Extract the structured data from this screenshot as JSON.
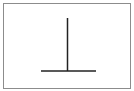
{
  "diagram": {
    "type": "inverted-t-shape",
    "frame": {
      "border_color": "#8c8c8c",
      "background": "#ffffff"
    },
    "stroke_color": "#222222",
    "vertical_line": {
      "x": 67.5,
      "y1": 18,
      "y2": 71
    },
    "horizontal_line": {
      "x1": 41,
      "x2": 96,
      "y": 71
    }
  }
}
